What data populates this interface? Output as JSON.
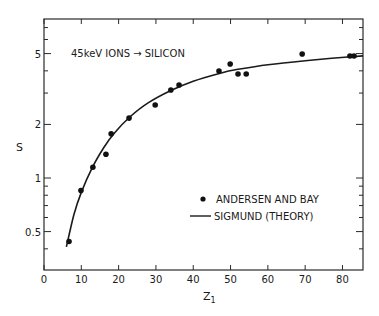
{
  "chart_data": {
    "type": "scatter",
    "title": "",
    "annotation": "45keV IONS → SILICON",
    "xlabel": "Z",
    "xlabel_subscript": "1",
    "ylabel": "S",
    "xlim": [
      0,
      85.5
    ],
    "ylim": [
      0.3,
      7.8
    ],
    "yscale": "log",
    "grid": false,
    "legend_position": "lower right",
    "x_ticks": [
      0,
      10,
      20,
      30,
      40,
      50,
      60,
      70,
      80
    ],
    "x_tick_labels": [
      "0",
      "10",
      "20",
      "30",
      "40",
      "50",
      "60",
      "70",
      "80"
    ],
    "y_tick_labels": [
      {
        "value": 0.5,
        "label": "0.5"
      },
      {
        "value": 1,
        "label": "1"
      },
      {
        "value": 2,
        "label": "2"
      },
      {
        "value": 5,
        "label": "5"
      }
    ],
    "y_minor_ticks": [
      0.4,
      0.6,
      0.7,
      0.8,
      0.9,
      3,
      4,
      6,
      7
    ],
    "series": [
      {
        "name": "ANDERSEN AND BAY",
        "kind": "points",
        "marker": "filled-circle",
        "x": [
          6.7,
          9.9,
          13.1,
          16.6,
          18.0,
          22.8,
          29.8,
          34.0,
          36.2,
          46.9,
          49.9,
          52.0,
          54.2,
          69.2,
          82.0,
          83.1
        ],
        "y": [
          0.44,
          0.85,
          1.15,
          1.36,
          1.77,
          2.17,
          2.57,
          3.12,
          3.33,
          3.99,
          4.37,
          3.84,
          3.84,
          4.97,
          4.85,
          4.85
        ]
      },
      {
        "name": "SIGMUND (THEORY)",
        "kind": "line",
        "x": [
          6.0,
          8.0,
          10.0,
          13.0,
          16.0,
          19.0,
          23.0,
          28.0,
          34.0,
          40.0,
          47.0,
          52.0,
          60.0,
          70.0,
          78.0,
          85.5
        ],
        "y": [
          0.41,
          0.62,
          0.83,
          1.15,
          1.48,
          1.8,
          2.2,
          2.65,
          3.1,
          3.5,
          3.87,
          4.08,
          4.33,
          4.56,
          4.72,
          4.85
        ]
      }
    ]
  }
}
